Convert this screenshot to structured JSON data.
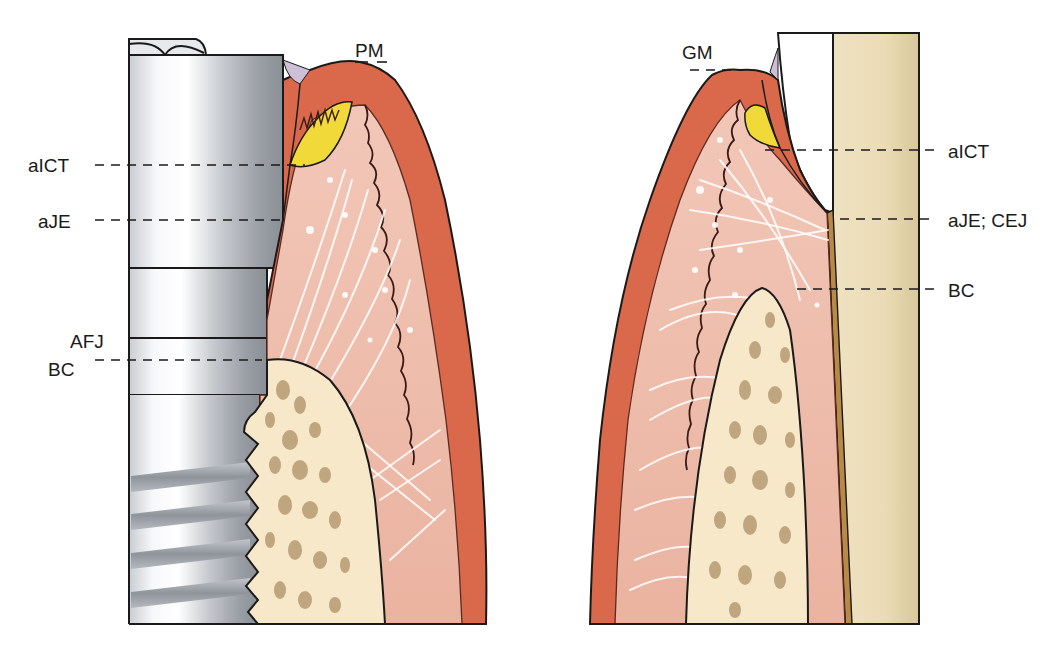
{
  "figure": {
    "colors": {
      "epithelium": "#d9694a",
      "connective_tissue": "#efbfae",
      "junctional_epithelium_yellow": "#f1d93a",
      "bone": "#f6e8c8",
      "bone_pores": "#b59a72",
      "tooth_root": "#e6d6b0",
      "cementum": "#b88a45",
      "implant_metal_light": "#f4f5f7",
      "implant_metal_dark": "#8e9299",
      "sulcus_membrane": "#cdbfd6"
    }
  },
  "left_panel": {
    "title": "implant",
    "labels": {
      "pm": "PM",
      "aict": "aICT",
      "aje": "aJE",
      "afj": "AFJ",
      "bc": "BC"
    }
  },
  "right_panel": {
    "title": "tooth",
    "labels": {
      "gm": "GM",
      "aict": "aICT",
      "aje_cej": "aJE; CEJ",
      "bc": "BC"
    }
  }
}
